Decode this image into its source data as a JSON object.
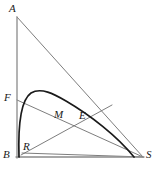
{
  "figure": {
    "kind": "geometry-diagram",
    "canvas": {
      "width": 160,
      "height": 177
    },
    "colors": {
      "background": "#ffffff",
      "thin_line": "#6e6e6e",
      "axis_line": "#8a8a8a",
      "curve": "#1a1a1a",
      "label_text": "#1a1a1a"
    },
    "stroke_widths": {
      "thin_line": 0.9,
      "axis_line": 1.3,
      "curve": 1.7
    },
    "points": [
      {
        "id": "A",
        "label": "A",
        "x": 17,
        "y": 17,
        "label_x": 9,
        "label_y": 3
      },
      {
        "id": "F",
        "label": "F",
        "x": 17,
        "y": 100,
        "label_x": 4,
        "label_y": 92
      },
      {
        "id": "B",
        "label": "B",
        "x": 17,
        "y": 157,
        "label_x": 3,
        "label_y": 149
      },
      {
        "id": "R",
        "label": "R",
        "x": 22,
        "y": 157,
        "label_x": 23,
        "label_y": 141
      },
      {
        "id": "M",
        "label": "M",
        "x": 58,
        "y": 120,
        "label_x": 54,
        "label_y": 109
      },
      {
        "id": "E",
        "label": "E",
        "x": 84,
        "y": 122,
        "label_x": 79,
        "label_y": 110
      },
      {
        "id": "S",
        "label": "S",
        "x": 143,
        "y": 157,
        "label_x": 146,
        "label_y": 149
      }
    ],
    "segments": [
      {
        "id": "AB",
        "name": "segment-ab",
        "from": "A",
        "to": "B",
        "style": "axis_line"
      },
      {
        "id": "BS",
        "name": "segment-bs",
        "from": "B",
        "to": "S",
        "style": "axis_line"
      },
      {
        "id": "AS",
        "name": "segment-as",
        "from": "A",
        "to": "S",
        "style": "thin_line"
      },
      {
        "id": "FS",
        "name": "segment-fs",
        "from": "F",
        "to": "S",
        "style": "thin_line"
      },
      {
        "id": "RE",
        "name": "segment-r-to-s",
        "from": "R",
        "to": "S",
        "style": "thin_line"
      }
    ],
    "curve": {
      "id": "BS-arc",
      "name": "curve-b-to-s",
      "style": "curve",
      "start": {
        "x": 19,
        "y": 157
      },
      "control_1": {
        "x": 19,
        "y": 100
      },
      "control_2": {
        "x": 33,
        "y": 92
      },
      "control_3": {
        "x": 45,
        "y": 96
      },
      "control_4": {
        "x": 72,
        "y": 104
      },
      "control_5": {
        "x": 108,
        "y": 126
      },
      "end": {
        "x": 134,
        "y": 157
      },
      "path": "M 19 157 C 18 126 21 100 31 93 C 41 87 54 94 66 101 C 90 115 117 136 134 157"
    }
  }
}
